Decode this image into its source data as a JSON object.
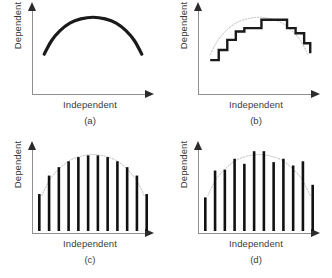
{
  "figure": {
    "background": "#ffffff",
    "axis_color": "#8f8f8f",
    "arrow_color": "#2b2b2b",
    "curve_color": "#1a1a1a",
    "dotted_curve_color": "#bdbdbd",
    "bar_color": "#111111",
    "label_color": "#3b3b3b"
  },
  "panels": [
    {
      "id": "a",
      "caption": "(a)",
      "ylabel": "Dependent",
      "xlabel": "Independent",
      "kind": "smooth-curve",
      "chart_data": {
        "type": "line",
        "title": "(a)",
        "xlabel": "Independent",
        "ylabel": "Dependent",
        "xlim": [
          0,
          1
        ],
        "ylim": [
          0,
          1
        ],
        "grid": false,
        "legend": "none",
        "series": [
          {
            "name": "underlying response curve",
            "style": "solid-thick",
            "x": [
              0.1,
              0.16,
              0.23,
              0.31,
              0.4,
              0.5,
              0.6,
              0.69,
              0.77,
              0.84,
              0.9
            ],
            "y": [
              0.45,
              0.61,
              0.73,
              0.82,
              0.87,
              0.89,
              0.87,
              0.82,
              0.73,
              0.61,
              0.45
            ]
          }
        ]
      }
    },
    {
      "id": "b",
      "caption": "(b)",
      "ylabel": "Dependent",
      "xlabel": "Independent",
      "kind": "step-curve",
      "chart_data": {
        "type": "line",
        "title": "(b)",
        "xlabel": "Independent",
        "ylabel": "Dependent",
        "xlim": [
          0,
          1
        ],
        "ylim": [
          0,
          1
        ],
        "grid": false,
        "legend": "none",
        "series": [
          {
            "name": "reference curve",
            "style": "dotted-thin",
            "x": [
              0.1,
              0.16,
              0.23,
              0.31,
              0.4,
              0.5,
              0.6,
              0.69,
              0.77,
              0.84,
              0.9
            ],
            "y": [
              0.45,
              0.61,
              0.73,
              0.82,
              0.87,
              0.89,
              0.87,
              0.82,
              0.73,
              0.61,
              0.45
            ]
          },
          {
            "name": "step approximation",
            "style": "step-thick",
            "x": [
              0.1,
              0.17,
              0.24,
              0.31,
              0.38,
              0.45,
              0.52,
              0.59,
              0.66,
              0.73,
              0.8,
              0.87,
              0.92
            ],
            "y": [
              0.38,
              0.5,
              0.62,
              0.72,
              0.76,
              0.76,
              0.86,
              0.86,
              0.86,
              0.76,
              0.7,
              0.58,
              0.46
            ]
          }
        ]
      }
    },
    {
      "id": "c",
      "caption": "(c)",
      "ylabel": "Dependent",
      "xlabel": "Independent",
      "kind": "bars-on-curve",
      "chart_data": {
        "type": "bar",
        "title": "(c)",
        "xlabel": "Independent",
        "ylabel": "Dependent",
        "xlim": [
          0,
          1
        ],
        "ylim": [
          0,
          1
        ],
        "grid": false,
        "legend": "none",
        "reference_curve": {
          "name": "underlying curve",
          "style": "dotted-thin",
          "x": [
            0.08,
            0.15,
            0.23,
            0.31,
            0.4,
            0.5,
            0.6,
            0.69,
            0.77,
            0.85,
            0.92
          ],
          "y": [
            0.42,
            0.62,
            0.75,
            0.84,
            0.89,
            0.91,
            0.89,
            0.84,
            0.75,
            0.62,
            0.42
          ]
        },
        "categories": [
          "1",
          "2",
          "3",
          "4",
          "5",
          "6",
          "7",
          "8",
          "9",
          "10",
          "11",
          "12"
        ],
        "values": [
          0.44,
          0.66,
          0.76,
          0.83,
          0.88,
          0.9,
          0.9,
          0.88,
          0.83,
          0.76,
          0.66,
          0.44
        ]
      }
    },
    {
      "id": "d",
      "caption": "(d)",
      "ylabel": "Dependent",
      "xlabel": "Independent",
      "kind": "bars-with-noise",
      "chart_data": {
        "type": "bar",
        "title": "(d)",
        "xlabel": "Independent",
        "ylabel": "Dependent",
        "xlim": [
          0,
          1
        ],
        "ylim": [
          0,
          1
        ],
        "grid": false,
        "legend": "none",
        "reference_curve": {
          "name": "underlying curve",
          "style": "dotted-thin",
          "x": [
            0.08,
            0.15,
            0.23,
            0.31,
            0.4,
            0.5,
            0.6,
            0.69,
            0.77,
            0.85,
            0.92
          ],
          "y": [
            0.42,
            0.62,
            0.75,
            0.84,
            0.89,
            0.91,
            0.89,
            0.84,
            0.75,
            0.62,
            0.42
          ]
        },
        "categories": [
          "1",
          "2",
          "3",
          "4",
          "5",
          "6",
          "7",
          "8",
          "9",
          "10",
          "11",
          "12"
        ],
        "values": [
          0.4,
          0.72,
          0.73,
          0.86,
          0.8,
          0.95,
          0.95,
          0.82,
          0.86,
          0.78,
          0.83,
          0.55
        ]
      }
    }
  ]
}
